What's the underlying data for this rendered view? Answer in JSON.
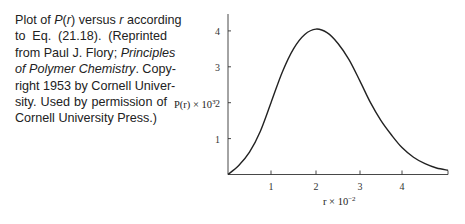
{
  "caption": {
    "lines": [
      {
        "parts": [
          {
            "t": "Plot of ",
            "i": false
          },
          {
            "t": "P",
            "i": true
          },
          {
            "t": "(",
            "i": false
          },
          {
            "t": "r",
            "i": true
          },
          {
            "t": ") versus ",
            "i": false
          },
          {
            "t": "r",
            "i": true
          },
          {
            "t": " according",
            "i": false
          }
        ]
      },
      {
        "parts": [
          {
            "t": "to Eq. (21.18). (Reprinted",
            "i": false
          }
        ]
      },
      {
        "parts": [
          {
            "t": "from Paul J. Flory; ",
            "i": false
          },
          {
            "t": "Principles",
            "i": true
          }
        ]
      },
      {
        "parts": [
          {
            "t": "of Polymer Chemistry",
            "i": true
          },
          {
            "t": ". Copy-",
            "i": false
          }
        ]
      },
      {
        "parts": [
          {
            "t": "right 1953 by Cornell Univer-",
            "i": false
          }
        ]
      },
      {
        "parts": [
          {
            "t": "sity. Used by permission of",
            "i": false
          }
        ]
      },
      {
        "parts": [
          {
            "t": "Cornell University Press.)",
            "i": false
          }
        ]
      }
    ]
  },
  "chart_data": {
    "type": "line",
    "title": "",
    "xlabel": "r × 10^-2",
    "ylabel": "P(r) × 10^3",
    "xlim": [
      0,
      5
    ],
    "ylim": [
      0,
      4.5
    ],
    "x_ticks": [
      1,
      2,
      3,
      4
    ],
    "y_ticks": [
      1,
      2,
      3,
      4
    ],
    "grid": false,
    "legend": null,
    "series": [
      {
        "name": "P(r)",
        "x": [
          0,
          0.25,
          0.5,
          0.75,
          1.0,
          1.25,
          1.5,
          1.75,
          2.0,
          2.25,
          2.5,
          2.75,
          3.0,
          3.25,
          3.5,
          3.75,
          4.0,
          4.25,
          4.5,
          4.75,
          5.0
        ],
        "values": [
          0,
          0.25,
          0.62,
          1.2,
          2.0,
          2.85,
          3.5,
          3.9,
          4.05,
          3.95,
          3.65,
          3.2,
          2.6,
          2.0,
          1.5,
          1.1,
          0.75,
          0.48,
          0.3,
          0.18,
          0.12
        ]
      }
    ]
  },
  "axis_labels": {
    "x_tick_labels": [
      "1",
      "2",
      "3",
      "4"
    ],
    "y_tick_labels": [
      "1",
      "2",
      "3",
      "4"
    ],
    "xlabel_base": "r × 10",
    "xlabel_exp": "−2",
    "ylabel_base": "P(r) × 10",
    "ylabel_exp": "3"
  }
}
